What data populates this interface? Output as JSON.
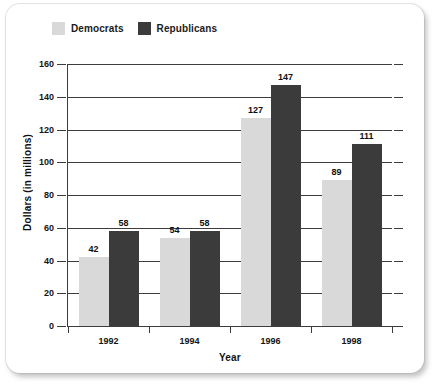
{
  "chart_data": {
    "type": "bar",
    "title": "",
    "xlabel": "Year",
    "ylabel": "Dollars (in millions)",
    "categories": [
      "1992",
      "1994",
      "1996",
      "1998"
    ],
    "series": [
      {
        "name": "Democrats",
        "color": "#d9d9d9",
        "values": [
          42,
          54,
          127,
          89
        ]
      },
      {
        "name": "Republicans",
        "color": "#3b3b3b",
        "values": [
          58,
          58,
          147,
          111
        ]
      }
    ],
    "ylim": [
      0,
      160
    ],
    "yticks": [
      0,
      20,
      40,
      60,
      80,
      100,
      120,
      140,
      160
    ],
    "ytick_labels": [
      "0",
      "20",
      "40",
      "60",
      "80",
      "100",
      "120",
      "140",
      "160"
    ],
    "grid": true,
    "legend_position": "top-left",
    "data_labels": true
  },
  "legend": {
    "entries": [
      {
        "label": "Democrats",
        "swatch": "legend-swatch-democrats"
      },
      {
        "label": "Republicans",
        "swatch": "legend-swatch-republicans"
      }
    ]
  }
}
